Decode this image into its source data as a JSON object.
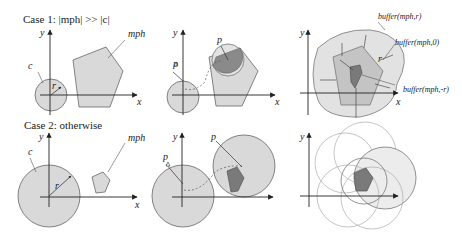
{
  "cases": [
    {
      "label": "Case 1: |mph| >> |c|"
    },
    {
      "label": "Case 2: otherwise"
    }
  ],
  "labels": {
    "x": "x",
    "y": "y",
    "c": "c",
    "r": "r",
    "mph": "mph",
    "p": "p",
    "p0": "p",
    "buffer_pos": "buffer(mph,r)",
    "buffer_zero": "buffer(mph,0)",
    "buffer_neg": "buffer(mph,-r)"
  },
  "colors": {
    "light_fill": "#d9d9d9",
    "mid_fill": "#bdbdbd",
    "dark_fill": "#7a7a7a",
    "stroke": "#555555",
    "axis": "#222222"
  }
}
